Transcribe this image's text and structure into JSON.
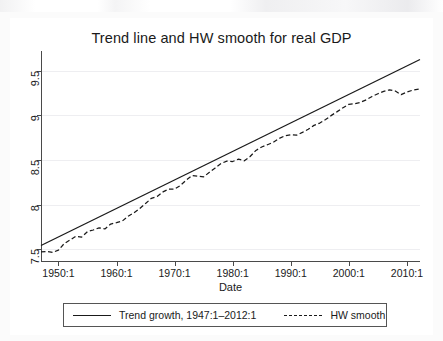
{
  "chart_data": {
    "type": "line",
    "title": "Trend line and HW smooth for real GDP",
    "xlabel": "Date",
    "ylabel": "",
    "xlim": [
      1947.0,
      2012.25
    ],
    "ylim": [
      7.36,
      9.72
    ],
    "grid": true,
    "legend_position": "bottom",
    "x_tick_labels": [
      "1950:1",
      "1960:1",
      "1970:1",
      "1980:1",
      "1990:1",
      "2000:1",
      "2010:1"
    ],
    "x_tick_values": [
      1950,
      1960,
      1970,
      1980,
      1990,
      2000,
      2010
    ],
    "y_tick_labels": [
      "7.5",
      "8",
      "8.5",
      "9",
      "9.5"
    ],
    "y_tick_values": [
      7.5,
      8,
      8.5,
      9,
      9.5
    ],
    "series": [
      {
        "name": "Trend growth, 1947:1–2012:1",
        "style": "solid",
        "color": "#1a1a1a",
        "x": [
          1947.0,
          2012.25
        ],
        "values": [
          7.545,
          9.625
        ]
      },
      {
        "name": "HW smooth",
        "style": "dashed",
        "color": "#1a1a1a",
        "x": [
          1947.0,
          1948.0,
          1949.0,
          1950.0,
          1951.0,
          1952.0,
          1953.0,
          1954.0,
          1955.0,
          1956.0,
          1957.0,
          1958.0,
          1959.0,
          1960.0,
          1961.0,
          1962.0,
          1963.0,
          1964.0,
          1965.0,
          1966.0,
          1967.0,
          1968.0,
          1969.0,
          1970.0,
          1971.0,
          1972.0,
          1973.0,
          1974.0,
          1975.0,
          1976.0,
          1977.0,
          1978.0,
          1979.0,
          1980.0,
          1981.0,
          1982.0,
          1983.0,
          1984.0,
          1985.0,
          1986.0,
          1987.0,
          1988.0,
          1989.0,
          1990.0,
          1991.0,
          1992.0,
          1993.0,
          1994.0,
          1995.0,
          1996.0,
          1997.0,
          1998.0,
          1999.0,
          2000.0,
          2001.0,
          2002.0,
          2003.0,
          2004.0,
          2005.0,
          2006.0,
          2007.0,
          2008.0,
          2009.0,
          2010.0,
          2011.0,
          2012.25
        ],
        "values": [
          7.472,
          7.478,
          7.468,
          7.492,
          7.566,
          7.606,
          7.648,
          7.638,
          7.7,
          7.718,
          7.742,
          7.73,
          7.784,
          7.8,
          7.818,
          7.872,
          7.91,
          7.958,
          8.014,
          8.072,
          8.094,
          8.144,
          8.176,
          8.176,
          8.216,
          8.276,
          8.326,
          8.32,
          8.312,
          8.364,
          8.412,
          8.462,
          8.488,
          8.484,
          8.51,
          8.492,
          8.54,
          8.608,
          8.646,
          8.672,
          8.7,
          8.742,
          8.772,
          8.782,
          8.778,
          8.81,
          8.844,
          8.888,
          8.914,
          8.954,
          9.0,
          9.042,
          9.086,
          9.124,
          9.13,
          9.146,
          9.174,
          9.212,
          9.242,
          9.268,
          9.286,
          9.272,
          9.232,
          9.262,
          9.282,
          9.296
        ]
      }
    ]
  },
  "legend": {
    "entries": [
      {
        "label": "Trend growth, 1947:1–2012:1",
        "style": "solid"
      },
      {
        "label": "HW smooth",
        "style": "dashed"
      }
    ]
  }
}
